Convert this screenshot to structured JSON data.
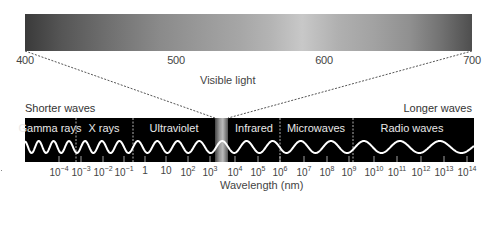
{
  "visible_light": {
    "label": "Visible light",
    "scale_ticks": [
      {
        "value": "400",
        "x": 25
      },
      {
        "value": "500",
        "x": 176
      },
      {
        "value": "600",
        "x": 324
      },
      {
        "value": "700",
        "x": 472
      }
    ]
  },
  "direction_labels": {
    "shorter": "Shorter waves",
    "longer": "Longer waves"
  },
  "bands": [
    {
      "name": "Gamma rays",
      "x": 50
    },
    {
      "name": "X rays",
      "x": 104
    },
    {
      "name": "Ultraviolet",
      "x": 174
    },
    {
      "name": "Infrared",
      "x": 254
    },
    {
      "name": "Microwaves",
      "x": 316
    },
    {
      "name": "Radio waves",
      "x": 412
    }
  ],
  "band_boundaries_x": [
    76,
    133,
    280,
    353
  ],
  "visible_strip": {
    "x_start": 215,
    "x_end": 228
  },
  "axis": {
    "title": "Wavelength (nm)",
    "ticks": [
      {
        "base": "10",
        "exp": "−4",
        "x": 59
      },
      {
        "base": "10",
        "exp": "−3",
        "x": 81
      },
      {
        "base": "10",
        "exp": "−2",
        "x": 103
      },
      {
        "base": "10",
        "exp": "−1",
        "x": 124
      },
      {
        "base": "1",
        "exp": "",
        "x": 145
      },
      {
        "base": "10",
        "exp": "",
        "x": 166
      },
      {
        "base": "10",
        "exp": "2",
        "x": 188
      },
      {
        "base": "10",
        "exp": "3",
        "x": 210
      },
      {
        "base": "10",
        "exp": "4",
        "x": 235
      },
      {
        "base": "10",
        "exp": "5",
        "x": 258
      },
      {
        "base": "10",
        "exp": "6",
        "x": 280
      },
      {
        "base": "10",
        "exp": "7",
        "x": 304
      },
      {
        "base": "10",
        "exp": "8",
        "x": 327
      },
      {
        "base": "10",
        "exp": "9",
        "x": 349
      },
      {
        "base": "10",
        "exp": "10",
        "x": 374
      },
      {
        "base": "10",
        "exp": "11",
        "x": 397
      },
      {
        "base": "10",
        "exp": "12",
        "x": 421
      },
      {
        "base": "10",
        "exp": "13",
        "x": 444
      },
      {
        "base": "10",
        "exp": "14",
        "x": 467
      }
    ]
  },
  "colors": {
    "band_background": "#000000",
    "wave": "#ffffff",
    "text": "#444444"
  }
}
